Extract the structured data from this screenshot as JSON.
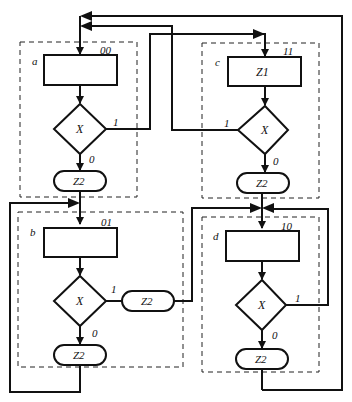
{
  "diagram": {
    "type": "flowchart",
    "colors": {
      "stroke": "#111111",
      "background": "#ffffff",
      "dashed": "#222222"
    },
    "blocks": [
      {
        "id": "a",
        "label": "a",
        "code": "00",
        "operator": "",
        "condition": "X",
        "branch_1": "1",
        "branch_0": "0",
        "output": "Z2"
      },
      {
        "id": "b",
        "label": "b",
        "code": "01",
        "operator": "",
        "condition": "X",
        "branch_1": "1",
        "branch_1_output": "Z2",
        "branch_0": "0",
        "output": "Z2"
      },
      {
        "id": "c",
        "label": "c",
        "code": "11",
        "operator": "Z1",
        "condition": "X",
        "branch_1": "1",
        "branch_0": "0",
        "output": "Z2"
      },
      {
        "id": "d",
        "label": "d",
        "code": "10",
        "operator": "",
        "condition": "X",
        "branch_1": "1",
        "branch_0": "0",
        "output": "Z2"
      }
    ]
  }
}
